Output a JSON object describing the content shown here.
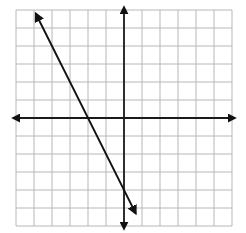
{
  "chart_data": {
    "type": "line",
    "title": "",
    "xlabel": "",
    "ylabel": "",
    "xlim": [
      -6,
      6
    ],
    "ylim": [
      -6,
      6
    ],
    "grid": true,
    "grid_step": 1,
    "axes_arrows": true,
    "series": [
      {
        "name": "line",
        "equation": "y = -2x - 4",
        "slope": -2,
        "y_intercept": -4,
        "x_intercept": -2,
        "x": [
          -4.9,
          0.65
        ],
        "y": [
          5.8,
          -5.3
        ],
        "arrows_both_ends": true
      }
    ]
  },
  "colors": {
    "grid": "#b8b8b8",
    "axis": "#1a1a1a",
    "line": "#111111",
    "background": "#ffffff"
  }
}
